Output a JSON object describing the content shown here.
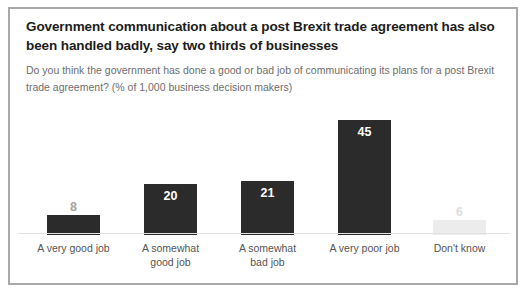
{
  "card": {
    "border_color": "#a9a9a9",
    "background": "#ffffff"
  },
  "chart_data": {
    "type": "bar",
    "title": "Government communication about a post Brexit trade agreement has also been handled badly, say two thirds of businesses",
    "subtitle": "Do you think the government has done a good or bad job of communicating its plans for a post Brexit trade agreement? (% of 1,000 business decision makers)",
    "xlabel": "",
    "ylabel": "",
    "ylim": [
      0,
      50
    ],
    "grid": false,
    "legend": "none",
    "value_suffix": "",
    "categories": [
      "A very good job",
      "A somewhat good job",
      "A somewhat bad job",
      "A very poor job",
      "Don't know"
    ],
    "values": [
      8,
      20,
      21,
      45,
      6
    ],
    "bars": [
      {
        "category": "A very good job",
        "category_line1": "A very good job",
        "category_line2": "",
        "value": 8,
        "value_text": "8",
        "color": "#2b2b2b",
        "label_position": "above",
        "label_color": "#a3a3a3"
      },
      {
        "category": "A somewhat good job",
        "category_line1": "A somewhat",
        "category_line2": "good job",
        "value": 20,
        "value_text": "20",
        "color": "#2b2b2b",
        "label_position": "inside",
        "label_color": "#ffffff"
      },
      {
        "category": "A somewhat bad job",
        "category_line1": "A somewhat",
        "category_line2": "bad job",
        "value": 21,
        "value_text": "21",
        "color": "#2b2b2b",
        "label_position": "inside",
        "label_color": "#ffffff"
      },
      {
        "category": "A very poor job",
        "category_line1": "A very poor job",
        "category_line2": "",
        "value": 45,
        "value_text": "45",
        "color": "#2b2b2b",
        "label_position": "inside",
        "label_color": "#ffffff"
      },
      {
        "category": "Don't know",
        "category_line1": "Don't know",
        "category_line2": "",
        "value": 6,
        "value_text": "6",
        "color": "#ececec",
        "label_position": "above",
        "label_color": "#dcdcdc"
      }
    ],
    "axis_line_color": "#e2e2e2"
  }
}
